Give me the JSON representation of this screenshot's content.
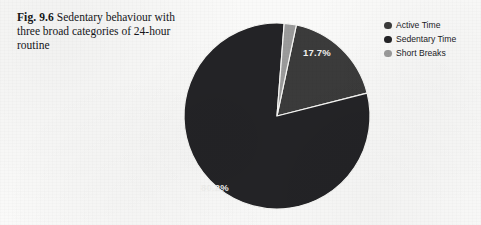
{
  "figure": {
    "label": "Fig. 9.6",
    "caption": "Sedentary behaviour with three broad categories of 24-hour routine"
  },
  "legend": {
    "position": "top-right",
    "items": [
      {
        "label": "Active Time",
        "color": "#3b3b3b"
      },
      {
        "label": "Sedentary Time",
        "color": "#232326"
      },
      {
        "label": "Short Breaks",
        "color": "#9b9b9b"
      }
    ]
  },
  "chart_data": {
    "type": "pie",
    "title": "",
    "subtitle": "",
    "xlabel": "",
    "ylabel": "",
    "grid": false,
    "legend_position": "top-right",
    "categories": [
      "Active Time",
      "Sedentary Time",
      "Short Breaks"
    ],
    "values": [
      17.7,
      80.2,
      2.1
    ],
    "value_unit": "%",
    "data_labels": [
      "17.7%",
      "",
      "80.2%"
    ],
    "visible_data_labels": [
      "17.7%",
      "80.2%"
    ],
    "colors": [
      "#3b3b3b",
      "#232326",
      "#9b9b9b"
    ],
    "start_angle_deg": 12,
    "direction": "clockwise",
    "center": {
      "x": 277,
      "y": 116
    },
    "radius": 93,
    "label_positions": [
      {
        "text": "17.7%",
        "x": 317,
        "y": 56
      },
      {
        "text": "80.2%",
        "x": 215,
        "y": 191
      }
    ]
  }
}
